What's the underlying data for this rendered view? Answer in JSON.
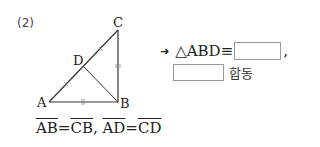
{
  "problem": {
    "number": "(2)",
    "figure": {
      "vertices": {
        "A": "A",
        "B": "B",
        "C": "C",
        "D": "D"
      }
    },
    "given": {
      "seg1": "AB",
      "eq1": "=",
      "seg2": "CB",
      "sep": ",",
      "seg3": "AD",
      "eq2": "=",
      "seg4": "CD"
    },
    "answer": {
      "arrow": "➜",
      "prefix": "△ABD≡",
      "blank1_value": "",
      "comma": ",",
      "blank2_value": "",
      "suffix": "합동"
    }
  }
}
